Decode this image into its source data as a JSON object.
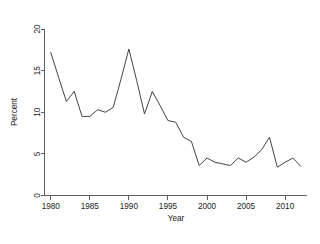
{
  "chart_data": {
    "type": "line",
    "title": "",
    "subtitle": "",
    "xlabel": "Year",
    "ylabel": "Percent",
    "xlim": [
      1979.2,
      2012.8
    ],
    "ylim": [
      0,
      20
    ],
    "xticks": [
      1980,
      1985,
      1990,
      1995,
      2000,
      2005,
      2010
    ],
    "xtick_labels": [
      "1980",
      "1985",
      "1990",
      "1995",
      "2000",
      "2005",
      "2010"
    ],
    "yticks": [
      0,
      5,
      10,
      15,
      20
    ],
    "ytick_labels": [
      "0",
      "5",
      "10",
      "15",
      "20"
    ],
    "grid": false,
    "legend": false,
    "legend_position": "none",
    "line_color": "#3a3a3a",
    "background_color": "#ffffff",
    "axis_color": "#4d4d4d",
    "x": [
      1980,
      1981,
      1982,
      1983,
      1984,
      1985,
      1986,
      1987,
      1988,
      1989,
      1990,
      1991,
      1992,
      1993,
      1994,
      1995,
      1996,
      1997,
      1998,
      1999,
      2000,
      2001,
      2002,
      2003,
      2004,
      2005,
      2006,
      2007,
      2008,
      2009,
      2010,
      2011,
      2012
    ],
    "series": [
      {
        "name": "Percent",
        "values": [
          17.2,
          14.2,
          11.3,
          12.5,
          9.5,
          9.5,
          10.3,
          10.0,
          10.6,
          14.0,
          17.6,
          13.8,
          9.8,
          12.5,
          10.8,
          9.0,
          8.8,
          7.0,
          6.5,
          3.6,
          4.5,
          4.0,
          3.8,
          3.6,
          4.5,
          4.0,
          4.6,
          5.5,
          7.0,
          3.4,
          4.0,
          4.5,
          3.5
        ]
      }
    ],
    "xtick_positions": [
      1980,
      1985,
      1990,
      1995,
      2000,
      2005,
      2010
    ],
    "annotations": []
  },
  "figure": {
    "width": 320,
    "height": 244
  }
}
